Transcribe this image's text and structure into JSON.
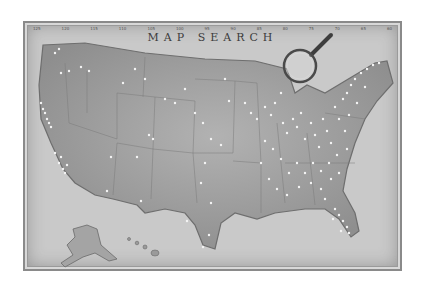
{
  "map": {
    "title": "MAP SEARCH",
    "longitude_ticks": [
      "125",
      "120",
      "115",
      "110",
      "105",
      "100",
      "95",
      "90",
      "85",
      "80",
      "75",
      "70",
      "65",
      "60"
    ],
    "colors": {
      "background": "#ffffff",
      "frame": "#c9c9c9",
      "land": "#a9a9a9",
      "land_dark": "#8c8c8c",
      "state_lines": "#7a7a7a",
      "pins": "#f4f4f4",
      "magnifier": "#4a4a4a"
    },
    "magnifier": {
      "icon": "magnifying-glass-icon",
      "cx": 298,
      "cy": 64,
      "r": 16
    },
    "regions": [
      "contiguous-us",
      "alaska",
      "hawaii"
    ]
  }
}
